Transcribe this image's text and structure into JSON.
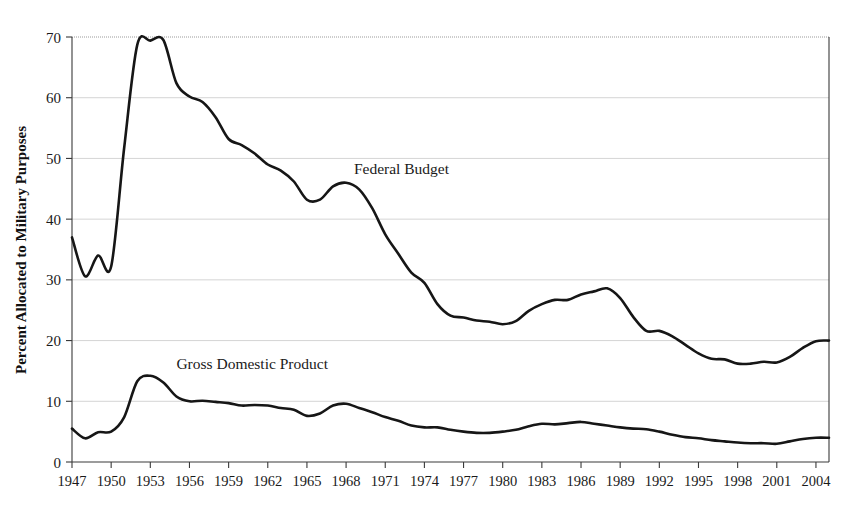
{
  "chart_data": {
    "type": "line",
    "title": "",
    "xlabel": "",
    "ylabel": "Percent Allocated to Military Purposes",
    "xlim": [
      1947,
      2005
    ],
    "ylim": [
      0,
      70
    ],
    "grid": true,
    "legend_position": "inline-annotation",
    "y_ticks": [
      0,
      10,
      20,
      30,
      40,
      50,
      60,
      70
    ],
    "x_ticks": [
      1947,
      1950,
      1953,
      1956,
      1959,
      1962,
      1965,
      1968,
      1971,
      1974,
      1977,
      1980,
      1983,
      1986,
      1989,
      1992,
      1995,
      1998,
      2001,
      2004
    ],
    "x": [
      1947,
      1948,
      1949,
      1950,
      1951,
      1952,
      1953,
      1954,
      1955,
      1956,
      1957,
      1958,
      1959,
      1960,
      1961,
      1962,
      1963,
      1964,
      1965,
      1966,
      1967,
      1968,
      1969,
      1970,
      1971,
      1972,
      1973,
      1974,
      1975,
      1976,
      1977,
      1978,
      1979,
      1980,
      1981,
      1982,
      1983,
      1984,
      1985,
      1986,
      1987,
      1988,
      1989,
      1990,
      1991,
      1992,
      1993,
      1994,
      1995,
      1996,
      1997,
      1998,
      1999,
      2000,
      2001,
      2002,
      2003,
      2004,
      2005
    ],
    "series": [
      {
        "name": "Federal Budget",
        "label_x": 1968.6,
        "label_y": 47.5,
        "values": [
          37.0,
          30.6,
          34.0,
          32.2,
          51.8,
          68.7,
          69.4,
          69.5,
          62.4,
          60.2,
          59.3,
          56.8,
          53.2,
          52.2,
          50.8,
          49.0,
          48.0,
          46.2,
          43.2,
          43.2,
          45.4,
          46.0,
          44.9,
          41.8,
          37.5,
          34.3,
          31.2,
          29.5,
          26.0,
          24.1,
          23.8,
          23.3,
          23.1,
          22.7,
          23.2,
          24.9,
          26.0,
          26.7,
          26.7,
          27.6,
          28.1,
          28.6,
          27.0,
          23.9,
          21.6,
          21.6,
          20.7,
          19.3,
          17.9,
          17.0,
          16.9,
          16.2,
          16.2,
          16.5,
          16.4,
          17.3,
          18.8,
          19.9,
          20.0
        ]
      },
      {
        "name": "Gross Domestic Product",
        "label_x": 1955.0,
        "label_y": 15.3,
        "values": [
          5.5,
          3.9,
          4.9,
          5.0,
          7.4,
          13.3,
          14.2,
          13.1,
          10.8,
          10.0,
          10.1,
          9.9,
          9.7,
          9.3,
          9.4,
          9.3,
          8.9,
          8.6,
          7.6,
          8.0,
          9.3,
          9.6,
          8.9,
          8.2,
          7.4,
          6.8,
          6.0,
          5.7,
          5.7,
          5.3,
          5.0,
          4.8,
          4.8,
          5.0,
          5.3,
          5.9,
          6.3,
          6.2,
          6.4,
          6.6,
          6.3,
          6.0,
          5.7,
          5.5,
          5.4,
          5.0,
          4.5,
          4.1,
          3.9,
          3.6,
          3.4,
          3.2,
          3.1,
          3.1,
          3.0,
          3.4,
          3.8,
          4.0,
          4.0
        ]
      }
    ]
  }
}
